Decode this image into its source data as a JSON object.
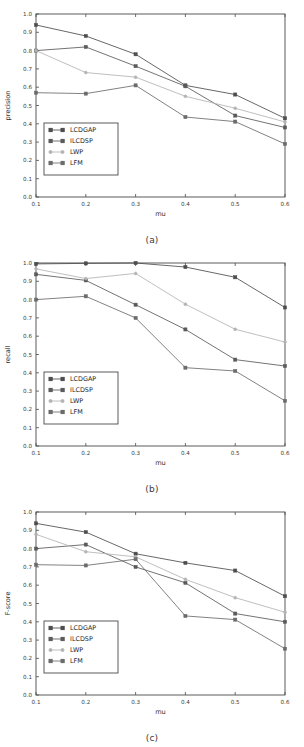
{
  "figure": {
    "panels": [
      {
        "caption": "(a)",
        "name": "precision-chart"
      },
      {
        "caption": "(b)",
        "name": "recall-chart"
      },
      {
        "caption": "(c)",
        "name": "fscore-chart"
      }
    ]
  },
  "series_colors": {
    "LCDGAP": "#4d4d4d",
    "ILCDSP": "#5a5a5a",
    "LWP": "#b4b4b4",
    "LFM": "#6b6b6b"
  },
  "axis": {
    "x_ticks": [
      "0.1",
      "0.2",
      "0.3",
      "0.4",
      "0.5",
      "0.6"
    ],
    "y_ticks": [
      "0.0",
      "0.1",
      "0.2",
      "0.3",
      "0.4",
      "0.5",
      "0.6",
      "0.7",
      "0.8",
      "0.9",
      "1.0"
    ],
    "xlabel": "mu"
  },
  "legend": {
    "entries": [
      "LCDGAP",
      "ILCDSP",
      "LWP",
      "LFM"
    ]
  },
  "chart_data": [
    {
      "type": "line",
      "title": "",
      "panel_label": "(a)",
      "xlabel": "mu",
      "ylabel": "precision",
      "x": [
        0.1,
        0.2,
        0.3,
        0.4,
        0.5,
        0.6
      ],
      "xlim": [
        0.1,
        0.6
      ],
      "ylim": [
        0.0,
        1.0
      ],
      "grid": false,
      "legend_position": "lower-left",
      "series": [
        {
          "name": "LCDGAP",
          "values": [
            0.94,
            0.88,
            0.78,
            0.61,
            0.56,
            0.43
          ]
        },
        {
          "name": "ILCDSP",
          "values": [
            0.8,
            0.82,
            0.715,
            0.605,
            0.445,
            0.38
          ]
        },
        {
          "name": "LWP",
          "values": [
            0.8,
            0.68,
            0.655,
            0.55,
            0.485,
            0.41
          ]
        },
        {
          "name": "LFM",
          "values": [
            0.57,
            0.565,
            0.61,
            0.437,
            0.412,
            0.29
          ]
        }
      ]
    },
    {
      "type": "line",
      "title": "",
      "panel_label": "(b)",
      "xlabel": "mu",
      "ylabel": "recall",
      "x": [
        0.1,
        0.2,
        0.3,
        0.4,
        0.5,
        0.6
      ],
      "xlim": [
        0.1,
        0.6
      ],
      "ylim": [
        0.0,
        1.0
      ],
      "grid": false,
      "legend_position": "lower-left",
      "series": [
        {
          "name": "LCDGAP",
          "values": [
            0.995,
            0.998,
            1.0,
            0.978,
            0.922,
            0.757
          ]
        },
        {
          "name": "ILCDSP",
          "values": [
            0.938,
            0.905,
            0.772,
            0.637,
            0.472,
            0.437
          ]
        },
        {
          "name": "LWP",
          "values": [
            0.968,
            0.915,
            0.943,
            0.775,
            0.638,
            0.568
          ]
        },
        {
          "name": "LFM",
          "values": [
            0.8,
            0.818,
            0.7,
            0.428,
            0.41,
            0.247
          ]
        }
      ]
    },
    {
      "type": "line",
      "title": "",
      "panel_label": "(c)",
      "xlabel": "mu",
      "ylabel": "F-score",
      "x": [
        0.1,
        0.2,
        0.3,
        0.4,
        0.5,
        0.6
      ],
      "xlim": [
        0.1,
        0.6
      ],
      "ylim": [
        0.0,
        1.0
      ],
      "grid": false,
      "legend_position": "lower-left",
      "series": [
        {
          "name": "LCDGAP",
          "values": [
            0.938,
            0.89,
            0.772,
            0.722,
            0.68,
            0.54
          ]
        },
        {
          "name": "ILCDSP",
          "values": [
            0.8,
            0.822,
            0.7,
            0.613,
            0.445,
            0.4
          ]
        },
        {
          "name": "LWP",
          "values": [
            0.878,
            0.783,
            0.755,
            0.632,
            0.532,
            0.452
          ]
        },
        {
          "name": "LFM",
          "values": [
            0.712,
            0.708,
            0.742,
            0.432,
            0.412,
            0.253
          ]
        }
      ]
    }
  ]
}
